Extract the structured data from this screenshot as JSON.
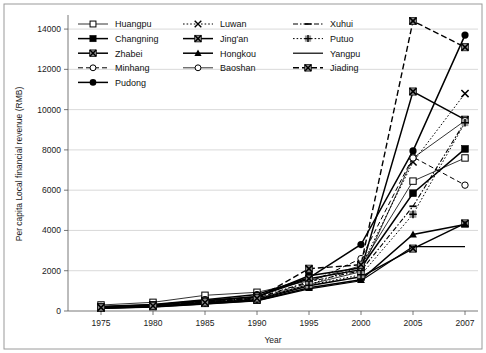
{
  "chart_data": {
    "type": "line",
    "title": "",
    "xlabel": "Year",
    "ylabel": "Per capita Local financial revenue (RMB)",
    "x": [
      1975,
      1980,
      1985,
      1990,
      1995,
      2000,
      2005,
      2007
    ],
    "xtick_labels": [
      "1975",
      "1980",
      "1985",
      "1990",
      "1995",
      "2000",
      "2005",
      "2007"
    ],
    "ytick_labels": [
      "0",
      "2000",
      "4000",
      "6000",
      "8000",
      "10000",
      "12000",
      "14000"
    ],
    "yticks": [
      0,
      2000,
      4000,
      6000,
      8000,
      10000,
      12000,
      14000
    ],
    "ylim": [
      0,
      14600
    ],
    "grid": "horizontal",
    "legend_position": "top-inside",
    "series": [
      {
        "name": "Huangpu",
        "marker": "open-square",
        "line": "solid-thin",
        "values": [
          300,
          430,
          780,
          930,
          1500,
          2250,
          6450,
          7600
        ]
      },
      {
        "name": "Changning",
        "marker": "filled-square",
        "line": "solid-bold",
        "values": [
          210,
          300,
          520,
          700,
          1750,
          2150,
          5850,
          8050
        ]
      },
      {
        "name": "Zhabei",
        "marker": "cross-square",
        "line": "solid-bold",
        "values": [
          150,
          230,
          390,
          560,
          1250,
          1700,
          3100,
          4350
        ]
      },
      {
        "name": "Minhang",
        "marker": "open-circle",
        "line": "dashed",
        "values": [
          180,
          260,
          440,
          640,
          1400,
          2600,
          7650,
          6250
        ]
      },
      {
        "name": "Pudong",
        "marker": "filled-circle",
        "line": "solid-bold",
        "values": [
          230,
          320,
          560,
          820,
          1650,
          3300,
          7950,
          13700
        ]
      },
      {
        "name": "Luwan",
        "marker": "cross-x",
        "line": "dotted",
        "values": [
          160,
          240,
          400,
          600,
          1300,
          2200,
          7400,
          10800
        ]
      },
      {
        "name": "Jing'an",
        "marker": "cross-square",
        "line": "solid-bold",
        "values": [
          200,
          290,
          500,
          720,
          1600,
          2050,
          10900,
          9500
        ]
      },
      {
        "name": "Hongkou",
        "marker": "filled-tri",
        "line": "solid-bold",
        "values": [
          140,
          210,
          360,
          520,
          1150,
          1550,
          3800,
          4300
        ]
      },
      {
        "name": "Baoshan",
        "marker": "open-circle",
        "line": "solid-thin",
        "values": [
          170,
          250,
          420,
          610,
          1320,
          1950,
          7600,
          9450
        ]
      },
      {
        "name": "Xuhui",
        "marker": "dash-mark",
        "line": "dash-dot",
        "values": [
          190,
          270,
          460,
          660,
          1450,
          2000,
          5200,
          9400
        ]
      },
      {
        "name": "Putuo",
        "marker": "plus-mark",
        "line": "dotted-plus",
        "values": [
          155,
          235,
          405,
          590,
          1280,
          1800,
          4800,
          9350
        ]
      },
      {
        "name": "Yangpu",
        "marker": "none",
        "line": "solid-plain",
        "values": [
          130,
          195,
          340,
          500,
          1100,
          1500,
          3200,
          3200
        ]
      },
      {
        "name": "Jiading",
        "marker": "cross-square",
        "line": "dashed-bold",
        "values": [
          175,
          255,
          430,
          630,
          2100,
          2300,
          14400,
          13100
        ]
      }
    ],
    "legend": [
      {
        "label": "Huangpu",
        "marker": "open-square",
        "line": "solid-thin"
      },
      {
        "label": "Luwan",
        "marker": "cross-x",
        "line": "dotted"
      },
      {
        "label": "Xuhui",
        "marker": "dash-mark",
        "line": "dash-dot"
      },
      {
        "label": "Changning",
        "marker": "filled-square",
        "line": "solid-bold"
      },
      {
        "label": "Jing'an",
        "marker": "cross-square",
        "line": "solid-bold"
      },
      {
        "label": "Putuo",
        "marker": "plus-mark",
        "line": "dotted-plus"
      },
      {
        "label": "Zhabei",
        "marker": "cross-square",
        "line": "solid-bold"
      },
      {
        "label": "Hongkou",
        "marker": "filled-tri",
        "line": "solid-bold"
      },
      {
        "label": "Yangpu",
        "marker": "none",
        "line": "solid-plain"
      },
      {
        "label": "Minhang",
        "marker": "open-circle",
        "line": "dashed"
      },
      {
        "label": "Baoshan",
        "marker": "open-circle",
        "line": "solid-thin"
      },
      {
        "label": "Jiading",
        "marker": "cross-square",
        "line": "dashed-bold"
      },
      {
        "label": "Pudong",
        "marker": "filled-circle",
        "line": "solid-bold"
      }
    ],
    "colors": {
      "series": "#000000",
      "grid": "#c9c9c9",
      "axis": "#555555",
      "background": "#ffffff"
    }
  }
}
